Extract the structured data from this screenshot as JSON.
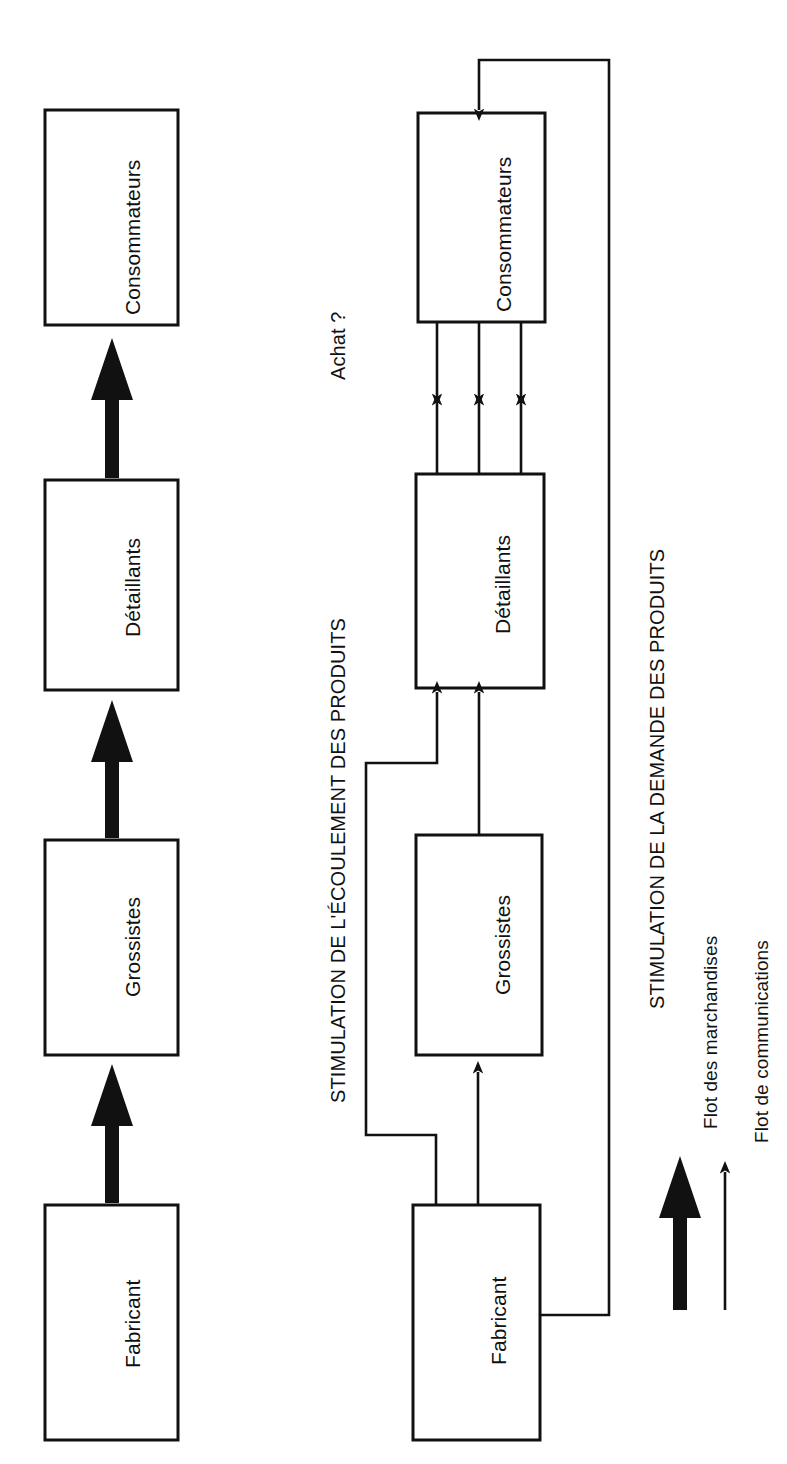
{
  "diagram": {
    "type": "flow-diagram",
    "title_implicit": "Flots de distribution",
    "panels": [
      {
        "id": "panel-products-flow",
        "caption": "STIMULATION DE L'ÉCOULEMENT DES PRODUITS",
        "extra_label": "Achat ?",
        "flow_style": "thick",
        "nodes": [
          {
            "id": "fabricant",
            "label": "Fabricant"
          },
          {
            "id": "grossistes",
            "label": "Grossistes"
          },
          {
            "id": "detaillants",
            "label": "Détaillants"
          },
          {
            "id": "consommateurs",
            "label": "Consommateurs"
          }
        ],
        "edges": [
          {
            "from": "fabricant",
            "to": "grossistes",
            "kind": "marchandises"
          },
          {
            "from": "grossistes",
            "to": "detaillants",
            "kind": "marchandises"
          },
          {
            "from": "detaillants",
            "to": "consommateurs",
            "kind": "marchandises"
          }
        ]
      },
      {
        "id": "panel-demand-flow",
        "caption": "STIMULATION DE LA DEMANDE DES PRODUITS",
        "flow_style": "thin",
        "nodes": [
          {
            "id": "fabricant2",
            "label": "Fabricant"
          },
          {
            "id": "grossistes2",
            "label": "Grossistes"
          },
          {
            "id": "detaillants2",
            "label": "Détaillants"
          },
          {
            "id": "consommateurs2",
            "label": "Consommateurs"
          }
        ],
        "edges": [
          {
            "from": "fabricant2",
            "to": "grossistes2",
            "kind": "communications"
          },
          {
            "from": "fabricant2",
            "to": "detaillants2",
            "kind": "communications"
          },
          {
            "from": "fabricant2",
            "to": "consommateurs2",
            "kind": "communications"
          },
          {
            "from": "grossistes2",
            "to": "detaillants2",
            "kind": "communications"
          },
          {
            "from": "detaillants2",
            "to": "consommateurs2",
            "kind": "communications",
            "count": 3
          },
          {
            "from": "consommateurs2",
            "to": "detaillants2",
            "kind": "communications",
            "count": 3
          }
        ]
      }
    ],
    "legend": {
      "items": [
        {
          "id": "legend-marchandises",
          "label": "Flot des marchandises",
          "arrow": "thick-arrow-icon"
        },
        {
          "id": "legend-communications",
          "label": "Flot de communications",
          "arrow": "thin-arrow-icon"
        }
      ]
    },
    "colors": {
      "ink": "#000000",
      "paper": "#ffffff"
    }
  }
}
